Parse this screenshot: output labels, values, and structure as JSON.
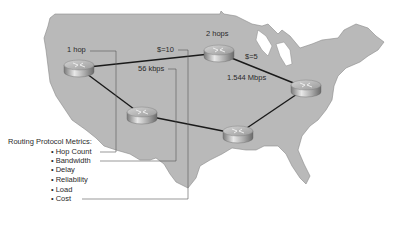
{
  "diagram": {
    "routers": [
      {
        "id": "router-west",
        "x": 79,
        "y": 68
      },
      {
        "id": "router-north",
        "x": 219,
        "y": 53
      },
      {
        "id": "router-east",
        "x": 306,
        "y": 88
      },
      {
        "id": "router-southwest",
        "x": 142,
        "y": 115
      },
      {
        "id": "router-south",
        "x": 238,
        "y": 134
      }
    ],
    "links": [
      [
        "router-west",
        "router-north"
      ],
      [
        "router-north",
        "router-east"
      ],
      [
        "router-west",
        "router-southwest"
      ],
      [
        "router-southwest",
        "router-south"
      ],
      [
        "router-south",
        "router-east"
      ]
    ],
    "labels": {
      "hop1": "1 hop",
      "hops2": "2 hops",
      "cost10": "$=10",
      "cost5": "$=5",
      "bw56": "56 kbps",
      "bw1544": "1.544 Mbps"
    },
    "colors": {
      "map_fill": "#b9b9b9",
      "map_edge": "#8a8a8a",
      "link": "#1a1a1a",
      "connector": "#555555"
    }
  },
  "legend": {
    "title": "Routing Protocol Metrics:",
    "items": [
      {
        "bullet": "•",
        "label": "Hop Count"
      },
      {
        "bullet": "•",
        "label": "Bandwidth"
      },
      {
        "bullet": "•",
        "label": "Delay"
      },
      {
        "bullet": "•",
        "label": "Reliability"
      },
      {
        "bullet": "•",
        "label": "Load"
      },
      {
        "bullet": "•",
        "label": "Cost"
      }
    ]
  }
}
